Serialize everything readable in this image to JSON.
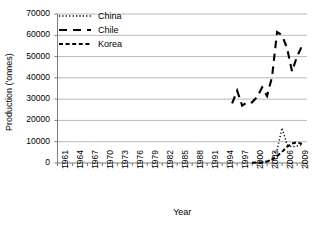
{
  "chart_data": {
    "type": "line",
    "title": "",
    "xlabel": "Year",
    "ylabel": "Production ('onnes)",
    "grid": true,
    "legend_position": "top-left",
    "xlim": [
      1961,
      2011
    ],
    "ylim": [
      0,
      70000
    ],
    "ytick_labels": [
      "70000",
      "60000",
      "50000",
      "40000",
      "30000",
      "20000",
      "10000",
      "0"
    ],
    "ytick_values": [
      70000,
      60000,
      50000,
      40000,
      30000,
      20000,
      10000,
      0
    ],
    "xtick_labels": [
      "1961",
      "1964",
      "1967",
      "1970",
      "1973",
      "1976",
      "1979",
      "1982",
      "1985",
      "1988",
      "1991",
      "1994",
      "1997",
      "2000",
      "2003",
      "2006",
      "2009"
    ],
    "xtick_values": [
      1961,
      1964,
      1967,
      1970,
      1973,
      1976,
      1979,
      1982,
      1985,
      1988,
      1991,
      1994,
      1997,
      2000,
      2003,
      2006,
      2009
    ],
    "series": [
      {
        "name": "China",
        "dash_style": "dotted",
        "x": [
          2000,
          2001,
          2002,
          2003,
          2004,
          2005,
          2006,
          2007,
          2008,
          2009,
          2010
        ],
        "values": [
          100,
          200,
          400,
          800,
          1800,
          6000,
          16500,
          8500,
          7500,
          8000,
          8700
        ]
      },
      {
        "name": "Chile",
        "dash_style": "long-dash",
        "x": [
          1996,
          1997,
          1998,
          1999,
          2000,
          2001,
          2002,
          2003,
          2004,
          2005,
          2006,
          2007,
          2008,
          2009,
          2010
        ],
        "values": [
          28000,
          34000,
          27000,
          28500,
          28500,
          31000,
          35500,
          31500,
          40500,
          61500,
          60000,
          54000,
          43000,
          50000,
          55000
        ]
      },
      {
        "name": "Korea",
        "dash_style": "short-dash",
        "x": [
          2000,
          2001,
          2002,
          2003,
          2004,
          2005,
          2006,
          2007,
          2008,
          2009,
          2010
        ],
        "values": [
          150,
          200,
          300,
          700,
          1600,
          3200,
          5200,
          7600,
          9200,
          9700,
          9000
        ]
      }
    ]
  },
  "legend": {
    "items": [
      {
        "label": "China"
      },
      {
        "label": "Chile"
      },
      {
        "label": "Korea"
      }
    ]
  },
  "axes": {
    "x_title": "Year",
    "y_title": "Production ('onnes)"
  }
}
